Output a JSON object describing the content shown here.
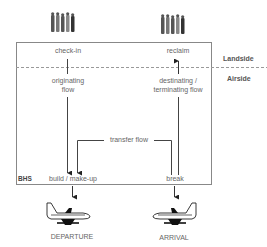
{
  "diagram": {
    "zones": {
      "landside": "Landside",
      "airside": "Airside",
      "system": "BHS"
    },
    "nodes": {
      "check_in": "check-in",
      "reclaim": "reclaim",
      "originating_flow": [
        "originating",
        "flow"
      ],
      "destinating_flow": [
        "destinating /",
        "terminating flow"
      ],
      "transfer_flow": "transfer flow",
      "build_makeup": "build / make-up",
      "break": "break",
      "departure": "DEPARTURE",
      "arrival": "ARRIVAL"
    },
    "icons": {
      "passengers_left": "passenger-group-icon",
      "passengers_right": "passenger-group-icon",
      "plane_departure": "airplane-icon",
      "plane_arrival": "airplane-icon"
    },
    "edges": [
      {
        "from": "check-in",
        "to": "build / make-up",
        "label": "originating flow"
      },
      {
        "from": "break",
        "to": "reclaim",
        "label": "destinating / terminating flow"
      },
      {
        "from": "break",
        "to": "build / make-up",
        "label": "transfer flow"
      },
      {
        "from": "build / make-up",
        "to": "DEPARTURE"
      },
      {
        "from": "ARRIVAL",
        "to": "break"
      }
    ],
    "colors": {
      "line": "#333333",
      "box": "#888888",
      "dashed": "#999999",
      "text": "#666666"
    }
  }
}
